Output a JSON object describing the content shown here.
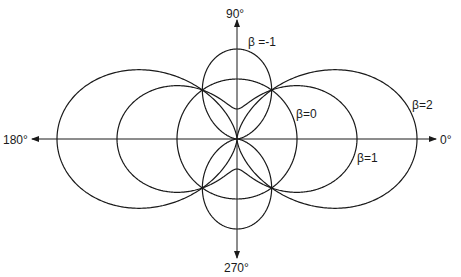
{
  "diagram": {
    "type": "polar-angular-distribution",
    "formula": "r = 1 + β·P2(cos θ)",
    "center": [
      237,
      139
    ],
    "unit_radius_px": 60,
    "axes": {
      "label_0": "0°",
      "label_90": "90°",
      "label_180": "180°",
      "label_270": "270°"
    },
    "curves": [
      {
        "beta": -1,
        "label": "β =-1",
        "label_pos": [
          248,
          46
        ]
      },
      {
        "beta": 0,
        "label": "β=0",
        "label_pos": [
          296,
          118
        ]
      },
      {
        "beta": 1,
        "label": "β=1",
        "label_pos": [
          357,
          162
        ]
      },
      {
        "beta": 2,
        "label": "β=2",
        "label_pos": [
          412,
          109
        ]
      }
    ],
    "stroke_color": "#1a1a1a",
    "background": "#ffffff"
  }
}
